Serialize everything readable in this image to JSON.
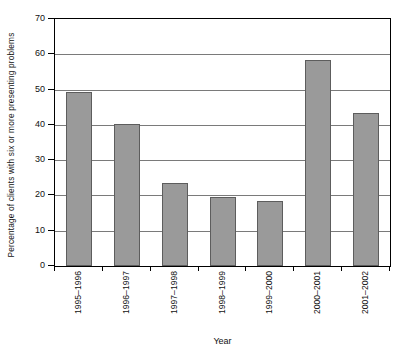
{
  "chart_data": {
    "type": "bar",
    "title": "",
    "xlabel": "Year",
    "ylabel": "Percentage of clients with six or more presenting problems",
    "categories": [
      "1995–1996",
      "1996–1997",
      "1997–1998",
      "1998–1999",
      "1999–2000",
      "2000–2001",
      "2001–2002"
    ],
    "values": [
      49.3,
      40.2,
      23.4,
      19.6,
      18.4,
      58.5,
      43.5
    ],
    "ylim": [
      0,
      70
    ],
    "ytick_values": [
      0,
      10,
      20,
      30,
      40,
      50,
      60,
      70
    ],
    "ytick_labels": [
      "0",
      "10",
      "20",
      "30",
      "40",
      "50",
      "60",
      "70"
    ],
    "grid": true,
    "grid_axis": "y",
    "legend": false,
    "legend_position": "none",
    "bar_fill_color": "#9a9a9a",
    "bar_border_color": "#5d5d5d",
    "gridline_color": "#7a7a7a",
    "axis_color": "#000000",
    "plot_background": "#ffffff"
  }
}
